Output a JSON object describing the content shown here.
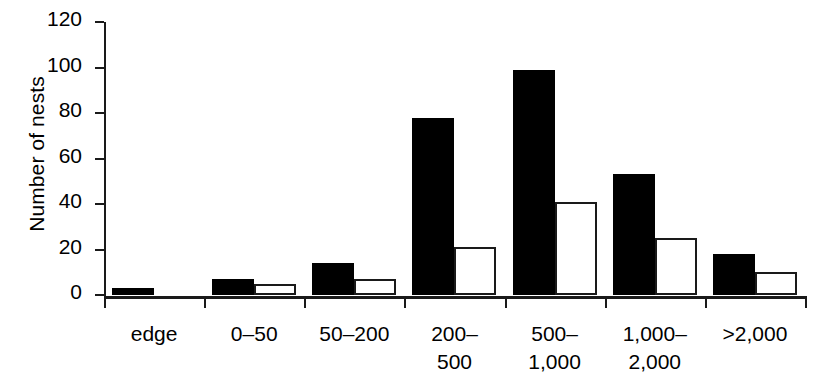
{
  "chart_data": {
    "type": "bar",
    "title": "",
    "xlabel": "",
    "ylabel": "Number of nests",
    "ylim": [
      0,
      120
    ],
    "yticks": [
      0,
      20,
      40,
      60,
      80,
      100,
      120
    ],
    "ytick_labels": [
      "0",
      "20",
      "40",
      "60",
      "80",
      "100",
      "120"
    ],
    "grid": false,
    "legend": "none",
    "categories": [
      "edge",
      "0–50",
      "50–200",
      "200–\n500",
      "500–\n1,000",
      "1,000–\n2,000",
      ">2,000"
    ],
    "series": [
      {
        "name": "black",
        "fill": "#000000",
        "values": [
          3,
          7,
          14,
          78,
          99,
          53,
          18
        ]
      },
      {
        "name": "white",
        "fill": "#ffffff",
        "values": [
          0,
          5,
          7,
          21,
          41,
          25,
          10
        ]
      }
    ]
  }
}
